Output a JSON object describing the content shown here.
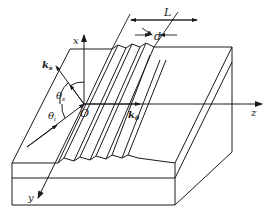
{
  "diagram": {
    "type": "perspective-schematic",
    "colors": {
      "line": "#1a1a1a",
      "background": "#ffffff"
    },
    "axes": {
      "x": "x",
      "y": "y",
      "z": "z",
      "origin": "O"
    },
    "vectors": {
      "scattered": {
        "label": "k",
        "subscript": "s"
      },
      "guided": {
        "label": "k",
        "subscript": "0"
      }
    },
    "angles": {
      "scattered": {
        "label": "θ",
        "subscript": "s"
      },
      "incident": {
        "label": "θ",
        "subscript": "i"
      }
    },
    "dimensions": {
      "grating_length": "L",
      "period": "d"
    }
  }
}
